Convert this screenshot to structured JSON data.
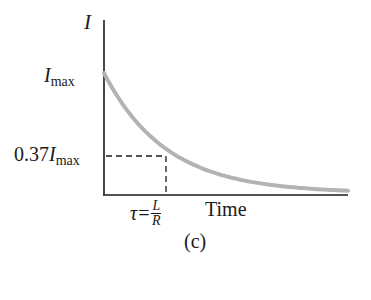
{
  "figure": {
    "caption": "(c)"
  },
  "axes": {
    "y_label": "I",
    "x_label": "Time"
  },
  "labels": {
    "imax_main": "I",
    "imax_sub": "max",
    "frac037_coef": "0.37",
    "frac037_main": "I",
    "frac037_sub": "max",
    "tau_symbol": "τ",
    "tau_eq": "=",
    "tau_num": "L",
    "tau_den": "R"
  },
  "colors": {
    "curve": "#b3b3b3",
    "axis": "#1a1a1a",
    "dash": "#1a1a1a"
  },
  "chart_data": {
    "type": "line",
    "title": "",
    "xlabel": "Time",
    "ylabel": "I",
    "caption": "(c)",
    "function": "I(t) = I_max * exp(-t / tau), tau = L/R",
    "y_ticks": [
      "I_max",
      "0.37 I_max"
    ],
    "x_ticks": [
      "tau = L/R"
    ],
    "series": [
      {
        "name": "current decay",
        "x_in_tau": [
          0,
          0.25,
          0.5,
          0.75,
          1,
          1.5,
          2,
          2.5,
          3,
          3.5,
          4
        ],
        "y_fraction_of_Imax": [
          1.0,
          0.78,
          0.61,
          0.47,
          0.37,
          0.22,
          0.14,
          0.08,
          0.05,
          0.03,
          0.02
        ]
      }
    ],
    "annotations": [
      {
        "type": "dashed-guide",
        "point": {
          "x_in_tau": 1,
          "y_fraction_of_Imax": 0.37
        },
        "text": "0.37 I_max at t = tau"
      }
    ],
    "grid": false,
    "legend": "none",
    "xlim_in_tau": [
      0,
      4
    ],
    "ylim_fraction": [
      0,
      1.05
    ]
  }
}
